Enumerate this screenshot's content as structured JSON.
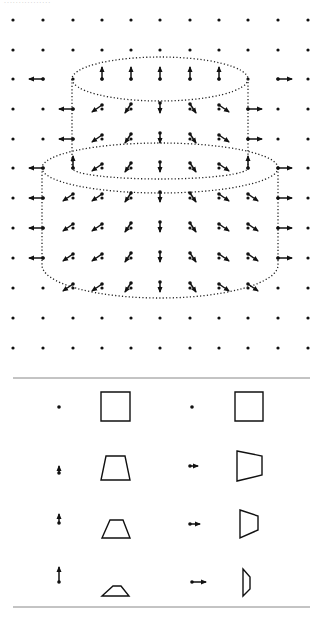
{
  "figure": {
    "background": "#ffffff",
    "ink": "#111111",
    "divider_color": "#888888"
  },
  "grid": {
    "xs": [
      13,
      43,
      73,
      102,
      131,
      160,
      190,
      219,
      248,
      278,
      308
    ],
    "ys": [
      20,
      50,
      79,
      109,
      139,
      168,
      198,
      228,
      258,
      288,
      318,
      348
    ],
    "dot_radius": 1.6
  },
  "cake": {
    "top_tier": {
      "cx": 160,
      "cy": 79,
      "rx": 88,
      "ry": 22,
      "bottom_y": 168,
      "bottom_ry": 11
    },
    "bottom_tier": {
      "cx": 160,
      "cy": 168,
      "rx": 118,
      "ry": 25,
      "bottom_y": 265,
      "bottom_ry": 33
    }
  },
  "arrows": [
    {
      "x": 43,
      "y": 79,
      "dx": -14,
      "dy": 0
    },
    {
      "x": 102,
      "y": 79,
      "dx": 0,
      "dy": -12
    },
    {
      "x": 131,
      "y": 79,
      "dx": 0,
      "dy": -12
    },
    {
      "x": 160,
      "y": 79,
      "dx": 0,
      "dy": -12
    },
    {
      "x": 190,
      "y": 79,
      "dx": 0,
      "dy": -12
    },
    {
      "x": 219,
      "y": 79,
      "dx": 0,
      "dy": -12
    },
    {
      "x": 278,
      "y": 79,
      "dx": 14,
      "dy": 0
    },
    {
      "x": 73,
      "y": 109,
      "dx": -14,
      "dy": 0
    },
    {
      "x": 102,
      "y": 105,
      "dx": -10,
      "dy": 7
    },
    {
      "x": 131,
      "y": 104,
      "dx": -6,
      "dy": 9
    },
    {
      "x": 160,
      "y": 103,
      "dx": 0,
      "dy": 10
    },
    {
      "x": 190,
      "y": 104,
      "dx": 6,
      "dy": 9
    },
    {
      "x": 219,
      "y": 105,
      "dx": 10,
      "dy": 7
    },
    {
      "x": 248,
      "y": 109,
      "dx": 14,
      "dy": 0
    },
    {
      "x": 73,
      "y": 139,
      "dx": -14,
      "dy": 0
    },
    {
      "x": 102,
      "y": 135,
      "dx": -10,
      "dy": 7
    },
    {
      "x": 131,
      "y": 134,
      "dx": -6,
      "dy": 9
    },
    {
      "x": 160,
      "y": 133,
      "dx": 0,
      "dy": 10
    },
    {
      "x": 190,
      "y": 134,
      "dx": 6,
      "dy": 9
    },
    {
      "x": 219,
      "y": 135,
      "dx": 10,
      "dy": 7
    },
    {
      "x": 248,
      "y": 139,
      "dx": 14,
      "dy": 0
    },
    {
      "x": 43,
      "y": 168,
      "dx": -14,
      "dy": 0
    },
    {
      "x": 73,
      "y": 168,
      "dx": 0,
      "dy": -12
    },
    {
      "x": 102,
      "y": 164,
      "dx": -10,
      "dy": 7
    },
    {
      "x": 131,
      "y": 163,
      "dx": -6,
      "dy": 9
    },
    {
      "x": 160,
      "y": 162,
      "dx": 0,
      "dy": 10
    },
    {
      "x": 190,
      "y": 163,
      "dx": 6,
      "dy": 9
    },
    {
      "x": 219,
      "y": 164,
      "dx": 10,
      "dy": 7
    },
    {
      "x": 248,
      "y": 168,
      "dx": 0,
      "dy": -12
    },
    {
      "x": 278,
      "y": 168,
      "dx": 14,
      "dy": 0
    },
    {
      "x": 43,
      "y": 198,
      "dx": -14,
      "dy": 0
    },
    {
      "x": 73,
      "y": 194,
      "dx": -10,
      "dy": 7
    },
    {
      "x": 102,
      "y": 194,
      "dx": -10,
      "dy": 7
    },
    {
      "x": 131,
      "y": 193,
      "dx": -6,
      "dy": 9
    },
    {
      "x": 160,
      "y": 192,
      "dx": 0,
      "dy": 10
    },
    {
      "x": 190,
      "y": 193,
      "dx": 6,
      "dy": 9
    },
    {
      "x": 219,
      "y": 194,
      "dx": 10,
      "dy": 7
    },
    {
      "x": 248,
      "y": 194,
      "dx": 10,
      "dy": 7
    },
    {
      "x": 278,
      "y": 198,
      "dx": 14,
      "dy": 0
    },
    {
      "x": 43,
      "y": 228,
      "dx": -14,
      "dy": 0
    },
    {
      "x": 73,
      "y": 224,
      "dx": -10,
      "dy": 7
    },
    {
      "x": 102,
      "y": 224,
      "dx": -10,
      "dy": 7
    },
    {
      "x": 131,
      "y": 223,
      "dx": -6,
      "dy": 9
    },
    {
      "x": 160,
      "y": 222,
      "dx": 0,
      "dy": 10
    },
    {
      "x": 190,
      "y": 223,
      "dx": 6,
      "dy": 9
    },
    {
      "x": 219,
      "y": 224,
      "dx": 10,
      "dy": 7
    },
    {
      "x": 248,
      "y": 224,
      "dx": 10,
      "dy": 7
    },
    {
      "x": 278,
      "y": 228,
      "dx": 14,
      "dy": 0
    },
    {
      "x": 43,
      "y": 258,
      "dx": -14,
      "dy": 0
    },
    {
      "x": 73,
      "y": 254,
      "dx": -10,
      "dy": 7
    },
    {
      "x": 102,
      "y": 254,
      "dx": -10,
      "dy": 7
    },
    {
      "x": 131,
      "y": 253,
      "dx": -6,
      "dy": 9
    },
    {
      "x": 160,
      "y": 252,
      "dx": 0,
      "dy": 10
    },
    {
      "x": 190,
      "y": 253,
      "dx": 6,
      "dy": 9
    },
    {
      "x": 219,
      "y": 254,
      "dx": 10,
      "dy": 7
    },
    {
      "x": 248,
      "y": 254,
      "dx": 10,
      "dy": 7
    },
    {
      "x": 278,
      "y": 258,
      "dx": 14,
      "dy": 0
    },
    {
      "x": 73,
      "y": 284,
      "dx": -10,
      "dy": 7
    },
    {
      "x": 102,
      "y": 284,
      "dx": -10,
      "dy": 7
    },
    {
      "x": 131,
      "y": 283,
      "dx": -6,
      "dy": 9
    },
    {
      "x": 160,
      "y": 282,
      "dx": 0,
      "dy": 10
    },
    {
      "x": 190,
      "y": 283,
      "dx": 6,
      "dy": 9
    },
    {
      "x": 219,
      "y": 284,
      "dx": 10,
      "dy": 7
    },
    {
      "x": 248,
      "y": 284,
      "dx": 10,
      "dy": 7
    }
  ],
  "legend": {
    "divider_top_y": 378,
    "divider_bottom_y": 607,
    "divider_x1": 13,
    "divider_x2": 310,
    "rows": [
      {
        "left_arrow": {
          "x": 59,
          "y": 407,
          "dx": 0,
          "dy": 0
        },
        "left_shape": [
          [
            101,
            392
          ],
          [
            130,
            392
          ],
          [
            130,
            421
          ],
          [
            101,
            421
          ]
        ],
        "right_arrow": {
          "x": 192,
          "y": 407,
          "dx": 0,
          "dy": 0
        },
        "right_shape": [
          [
            235,
            392
          ],
          [
            263,
            392
          ],
          [
            263,
            421
          ],
          [
            235,
            421
          ]
        ]
      },
      {
        "left_arrow": {
          "x": 59,
          "y": 473,
          "dx": 0,
          "dy": -7
        },
        "left_shape": [
          [
            106,
            456
          ],
          [
            125,
            456
          ],
          [
            130,
            480
          ],
          [
            101,
            480
          ]
        ],
        "right_arrow": {
          "x": 190,
          "y": 466,
          "dx": 8,
          "dy": 0
        },
        "right_shape": [
          [
            237,
            451
          ],
          [
            262,
            456
          ],
          [
            262,
            475
          ],
          [
            237,
            481
          ]
        ]
      },
      {
        "left_arrow": {
          "x": 59,
          "y": 523,
          "dx": 0,
          "dy": -9
        },
        "left_shape": [
          [
            110,
            520
          ],
          [
            123,
            520
          ],
          [
            130,
            538
          ],
          [
            102,
            538
          ]
        ],
        "right_arrow": {
          "x": 190,
          "y": 524,
          "dx": 10,
          "dy": 0
        },
        "right_shape": [
          [
            240,
            510
          ],
          [
            258,
            516
          ],
          [
            258,
            530
          ],
          [
            240,
            538
          ]
        ]
      },
      {
        "left_arrow": {
          "x": 59,
          "y": 582,
          "dx": 0,
          "dy": -15
        },
        "left_shape": [
          [
            113,
            586
          ],
          [
            121,
            586
          ],
          [
            129,
            596
          ],
          [
            102,
            596
          ]
        ],
        "right_arrow": {
          "x": 192,
          "y": 582,
          "dx": 14,
          "dy": 0
        },
        "right_shape": [
          [
            243,
            569
          ],
          [
            250,
            577
          ],
          [
            250,
            589
          ],
          [
            243,
            596
          ]
        ]
      }
    ]
  },
  "header": {
    "cropped_text": "................"
  }
}
